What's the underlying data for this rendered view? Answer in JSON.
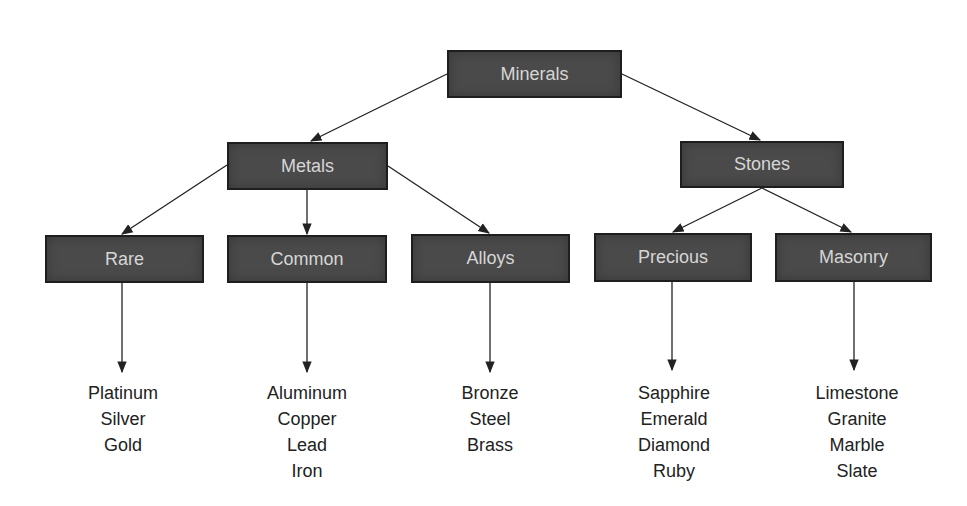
{
  "diagram": {
    "type": "tree",
    "colors": {
      "box_fill": "#4a4a4a",
      "box_border": "#1e1e1e",
      "box_text": "#d6d6d6",
      "leaf_text": "#222222",
      "edge": "#222222"
    },
    "root": {
      "label": "Minerals"
    },
    "level1": [
      {
        "label": "Metals"
      },
      {
        "label": "Stones"
      }
    ],
    "level2": [
      {
        "label": "Rare",
        "parent": "Metals",
        "items": [
          "Platinum",
          "Silver",
          "Gold"
        ]
      },
      {
        "label": "Common",
        "parent": "Metals",
        "items": [
          "Aluminum",
          "Copper",
          "Lead",
          "Iron"
        ]
      },
      {
        "label": "Alloys",
        "parent": "Metals",
        "items": [
          "Bronze",
          "Steel",
          "Brass"
        ]
      },
      {
        "label": "Precious",
        "parent": "Stones",
        "items": [
          "Sapphire",
          "Emerald",
          "Diamond",
          "Ruby"
        ]
      },
      {
        "label": "Masonry",
        "parent": "Stones",
        "items": [
          "Limestone",
          "Granite",
          "Marble",
          "Slate"
        ]
      }
    ]
  }
}
